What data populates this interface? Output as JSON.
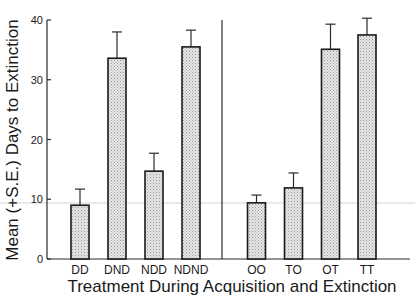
{
  "chart_data": {
    "type": "bar",
    "title": "",
    "xlabel": "Treatment During Acquisition and Extinction",
    "ylabel": "Mean (+S.E.) Days to Extinction",
    "ylim": [
      0,
      40
    ],
    "yticks": [
      0,
      10,
      20,
      30,
      40
    ],
    "grid": false,
    "legend": null,
    "groups": [
      {
        "categories": [
          "DD",
          "DND",
          "NDD",
          "NDND"
        ]
      },
      {
        "categories": [
          "OO",
          "TO",
          "OT",
          "TT"
        ]
      }
    ],
    "categories": [
      "DD",
      "DND",
      "NDD",
      "NDND",
      "OO",
      "TO",
      "OT",
      "TT"
    ],
    "values": [
      9.0,
      33.6,
      14.7,
      35.5,
      9.4,
      11.9,
      35.1,
      37.5
    ],
    "error_upper": [
      11.7,
      38.0,
      17.7,
      38.3,
      10.7,
      14.4,
      39.3,
      40.3
    ],
    "se": [
      2.7,
      4.4,
      3.0,
      2.8,
      1.3,
      2.5,
      4.2,
      2.8
    ],
    "annotations": [
      "vertical divider separating the two experiment groups"
    ],
    "colors": {
      "bar_fill": "#d9d9d9",
      "bar_edge": "#1a1a1a"
    }
  }
}
